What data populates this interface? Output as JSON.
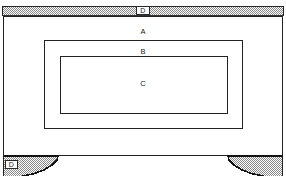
{
  "figure": {
    "kind": "technical-line-drawing",
    "background_color": "#ffffff",
    "line_color": "#222222",
    "hatch_color": "#777777",
    "labels": [
      {
        "id": "A",
        "text": "A",
        "role": "case-front-panel-label"
      },
      {
        "id": "B",
        "text": "B",
        "role": "outer-frame-label"
      },
      {
        "id": "C",
        "text": "C",
        "role": "inner-panel-label"
      },
      {
        "id": "D_top",
        "text": "D",
        "role": "top-board-edge-label"
      },
      {
        "id": "D_foot",
        "text": "D",
        "role": "bracket-foot-label"
      }
    ],
    "parts": {
      "top_board": {
        "name": "top board",
        "hatched": true,
        "label": "D"
      },
      "case": {
        "name": "case front",
        "hatched": false,
        "label": "A"
      },
      "outer_frame": {
        "name": "outer moulded frame",
        "hatched": false,
        "label": "B"
      },
      "inner_panel": {
        "name": "inner recessed panel",
        "hatched": false,
        "label": "C"
      },
      "left_foot": {
        "name": "left bracket foot",
        "hatched": true,
        "label": "D"
      },
      "right_foot": {
        "name": "right bracket foot",
        "hatched": true,
        "label": ""
      }
    }
  }
}
